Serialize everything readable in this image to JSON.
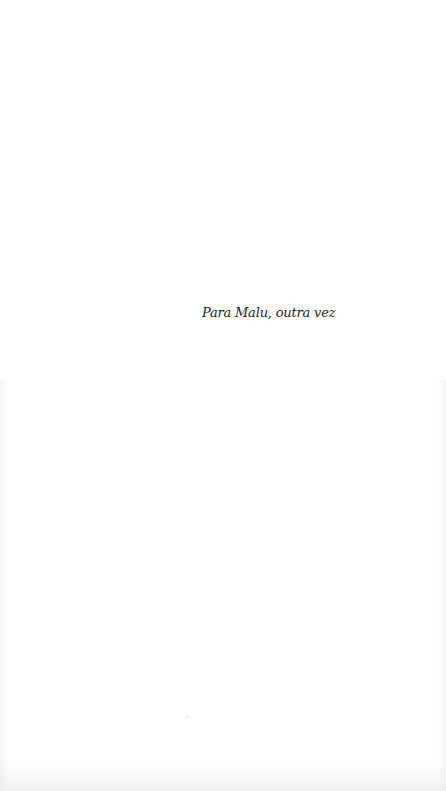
{
  "page": {
    "dedication": "Para Malu, outra vez",
    "background_color": "#ffffff",
    "text_color": "#222222"
  }
}
